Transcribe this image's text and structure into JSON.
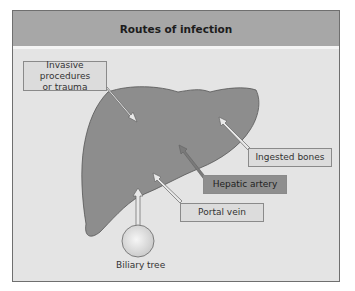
{
  "title": "Routes of infection",
  "labels": {
    "invasive": "Invasive procedures or trauma",
    "invasive_line1": "Invasive procedures",
    "invasive_line2": "or trauma",
    "ingested": "Ingested bones",
    "hepatic": "Hepatic artery",
    "portal": "Portal vein",
    "biliary": "Biliary tree"
  },
  "colors": {
    "header": "#a7a7a7",
    "background": "#e4e4e4",
    "liver": "#8d8d8d",
    "hepatic_box": "#8e8e8e",
    "light_box": "#dcdcdc"
  }
}
